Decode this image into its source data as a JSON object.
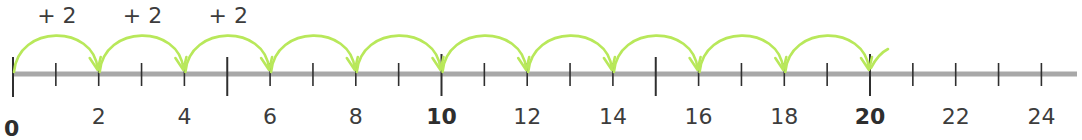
{
  "number_line": {
    "start": 0,
    "end": 24,
    "origin_x": 13,
    "unit_px": 42.85,
    "axis_y": 74,
    "axis_end_x": 1077,
    "axis_color": "#a8a8a8",
    "tick_color": "#2f2f2f",
    "major_ticks": [
      0,
      5,
      10,
      15,
      20
    ],
    "minor_ticks": [
      1,
      2,
      3,
      4,
      6,
      7,
      8,
      9,
      11,
      12,
      13,
      14,
      16,
      17,
      18,
      19,
      21,
      22,
      23,
      24
    ],
    "labels": [
      {
        "value": 0,
        "text": "0",
        "bold": true
      },
      {
        "value": 2,
        "text": "2",
        "bold": false
      },
      {
        "value": 4,
        "text": "4",
        "bold": false
      },
      {
        "value": 6,
        "text": "6",
        "bold": false
      },
      {
        "value": 8,
        "text": "8",
        "bold": false
      },
      {
        "value": 10,
        "text": "10",
        "bold": true
      },
      {
        "value": 12,
        "text": "12",
        "bold": false
      },
      {
        "value": 14,
        "text": "14",
        "bold": false
      },
      {
        "value": 16,
        "text": "16",
        "bold": false
      },
      {
        "value": 18,
        "text": "18",
        "bold": false
      },
      {
        "value": 20,
        "text": "20",
        "bold": true
      },
      {
        "value": 22,
        "text": "22",
        "bold": false
      },
      {
        "value": 24,
        "text": "24",
        "bold": false
      }
    ]
  },
  "jumps": {
    "step": 2,
    "color": "#b8e85a",
    "from": [
      0,
      2,
      4,
      6,
      8,
      10,
      12,
      14,
      16,
      18
    ],
    "labels": [
      {
        "text": "+ 2",
        "from": 0
      },
      {
        "text": "+ 2",
        "from": 2
      },
      {
        "text": "+ 2",
        "from": 4
      }
    ],
    "final_tail": true
  }
}
